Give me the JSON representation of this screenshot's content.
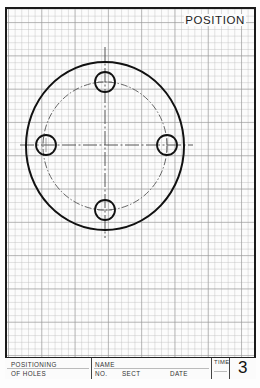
{
  "sheet": {
    "title": "POSITION",
    "grid": {
      "minor_spacing_px": 6.66,
      "major_every": 5,
      "color": "#b4b4b4"
    }
  },
  "drawing": {
    "description": "Circular flange with four equally spaced holes on a dash-dot bolt circle",
    "outer_circle": {
      "cx": 105,
      "cy": 146,
      "rx": 79,
      "ry": 84,
      "stroke": "#111111",
      "stroke_width": 2
    },
    "bolt_circle": {
      "cx": 105,
      "cy": 146,
      "rx": 62,
      "ry": 64,
      "style": "dash-dot",
      "stroke": "#555555"
    },
    "holes": [
      {
        "name": "top",
        "cx": 105,
        "cy": 82,
        "r": 10
      },
      {
        "name": "left",
        "cx": 46,
        "cy": 145,
        "r": 10
      },
      {
        "name": "right",
        "cx": 167,
        "cy": 145,
        "r": 10
      },
      {
        "name": "bottom",
        "cx": 105,
        "cy": 210,
        "r": 10
      }
    ],
    "centerlines": {
      "horizontal": {
        "x1": 20,
        "x2": 193,
        "y": 145
      },
      "vertical": {
        "x": 105,
        "y1": 47,
        "y2": 238
      }
    }
  },
  "title_block": {
    "exercise_line1": "POSITIONING",
    "exercise_line2": "OF HOLES",
    "name_label": "NAME",
    "no_label": "NO.",
    "sect_label": "SECT",
    "date_label": "DATE",
    "time_label": "TIME",
    "sheet_number": "3"
  }
}
